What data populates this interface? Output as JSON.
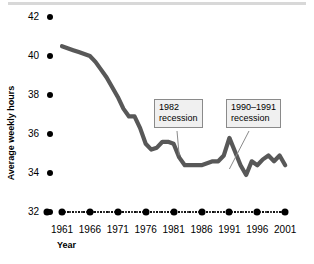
{
  "chart_data": {
    "type": "line",
    "title": "",
    "xlabel": "Year",
    "ylabel": "Average weekly hours",
    "xlim": [
      1960,
      2002
    ],
    "ylim": [
      32,
      42
    ],
    "yticks": [
      32,
      34,
      36,
      38,
      40,
      42
    ],
    "ytick_labels": [
      "32",
      "34",
      "36",
      "38",
      "40",
      "42"
    ],
    "xticks": [
      1961,
      1966,
      1971,
      1976,
      1981,
      1986,
      1991,
      1996,
      2001
    ],
    "xtick_labels": [
      "1961",
      "1966",
      "1971",
      "1976",
      "1981",
      "1986",
      "1991",
      "1996",
      "2001"
    ],
    "grid": false,
    "legend": null,
    "line_color": "#585858",
    "x": [
      1961,
      1962,
      1963,
      1964,
      1965,
      1966,
      1967,
      1968,
      1969,
      1970,
      1971,
      1972,
      1973,
      1974,
      1975,
      1976,
      1977,
      1978,
      1979,
      1980,
      1981,
      1982,
      1983,
      1984,
      1985,
      1986,
      1987,
      1988,
      1989,
      1990,
      1991,
      1992,
      1993,
      1994,
      1995,
      1996,
      1997,
      1998,
      1999,
      2000,
      2001
    ],
    "values": [
      40.5,
      40.4,
      40.3,
      40.2,
      40.1,
      40.0,
      39.7,
      39.3,
      38.9,
      38.4,
      37.9,
      37.3,
      36.9,
      36.9,
      36.3,
      35.5,
      35.2,
      35.3,
      35.6,
      35.6,
      35.5,
      34.8,
      34.4,
      34.4,
      34.4,
      34.4,
      34.5,
      34.6,
      34.6,
      34.9,
      35.8,
      35.1,
      34.4,
      33.9,
      34.6,
      34.4,
      34.7,
      34.9,
      34.6,
      34.9,
      34.4
    ],
    "annotations": [
      {
        "id": "1982-recession",
        "line1": "1982",
        "line2": "recession",
        "points_to_year": 1982,
        "points_to_value": 34.7
      },
      {
        "id": "1990-1991-recession",
        "line1": "1990–1991",
        "line2": "recession",
        "points_to_year": 1991,
        "points_to_value": 34.0
      }
    ]
  }
}
